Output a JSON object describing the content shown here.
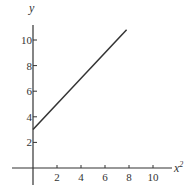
{
  "chart_data": {
    "type": "line",
    "title": "",
    "xlabel": "x",
    "xlabel_superscript": "2",
    "ylabel": "y",
    "xlim": [
      0,
      11
    ],
    "ylim": [
      0,
      12
    ],
    "x_ticks": [
      2,
      4,
      6,
      8,
      10
    ],
    "y_ticks": [
      2,
      4,
      6,
      8,
      10
    ],
    "x_tick_labels": [
      "2",
      "4",
      "6",
      "8",
      "10"
    ],
    "y_tick_labels": [
      "2",
      "4",
      "6",
      "8",
      "10"
    ],
    "grid": false,
    "series": [
      {
        "name": "y vs x^2",
        "x": [
          0,
          7.8
        ],
        "y": [
          3,
          10.8
        ],
        "color": "#333333"
      }
    ]
  }
}
